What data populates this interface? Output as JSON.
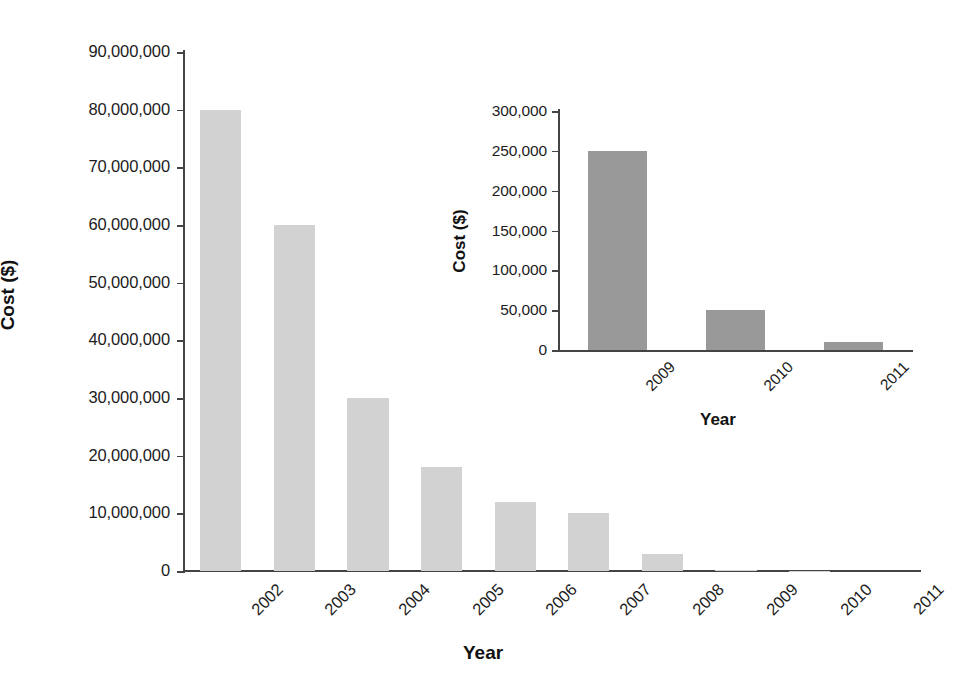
{
  "chart_data": [
    {
      "id": "main",
      "type": "bar",
      "title": "",
      "xlabel": "Year",
      "ylabel": "Cost ($)",
      "categories": [
        "2002",
        "2003",
        "2004",
        "2005",
        "2006",
        "2007",
        "2008",
        "2009",
        "2010",
        "2011"
      ],
      "values": [
        80000000,
        60000000,
        30000000,
        18000000,
        12000000,
        10000000,
        3000000,
        250000,
        50000,
        10000
      ],
      "ylim": [
        0,
        90000000
      ],
      "yticks": [
        0,
        10000000,
        20000000,
        30000000,
        40000000,
        50000000,
        60000000,
        70000000,
        80000000,
        90000000
      ],
      "ytick_labels": [
        "0",
        "10,000,000",
        "20,000,000",
        "30,000,000",
        "40,000,000",
        "50,000,000",
        "60,000,000",
        "70,000,000",
        "80,000,000",
        "90,000,000"
      ],
      "grid": false,
      "legend": "none",
      "bar_color": "#d2d2d2",
      "axis_color": "#444444",
      "tick_rotation": -45
    },
    {
      "id": "inset",
      "type": "bar",
      "title": "",
      "xlabel": "Year",
      "ylabel": "Cost ($)",
      "categories": [
        "2009",
        "2010",
        "2011"
      ],
      "values": [
        250000,
        50000,
        10000
      ],
      "ylim": [
        0,
        300000
      ],
      "yticks": [
        0,
        50000,
        100000,
        150000,
        200000,
        250000,
        300000
      ],
      "ytick_labels": [
        "0",
        "50,000",
        "100,000",
        "150,000",
        "200,000",
        "250,000",
        "300,000"
      ],
      "grid": false,
      "legend": "none",
      "bar_color": "#999999",
      "axis_color": "#444444",
      "tick_rotation": -45
    }
  ],
  "main": {
    "ylabel": "Cost ($)",
    "xlabel": "Year",
    "yticks": [
      {
        "label": "90,000,000",
        "value": 90000000
      },
      {
        "label": "80,000,000",
        "value": 80000000
      },
      {
        "label": "70,000,000",
        "value": 70000000
      },
      {
        "label": "60,000,000",
        "value": 60000000
      },
      {
        "label": "50,000,000",
        "value": 50000000
      },
      {
        "label": "40,000,000",
        "value": 40000000
      },
      {
        "label": "30,000,000",
        "value": 30000000
      },
      {
        "label": "20,000,000",
        "value": 20000000
      },
      {
        "label": "10,000,000",
        "value": 10000000
      },
      {
        "label": "0",
        "value": 0
      }
    ],
    "bars": [
      {
        "category": "2002",
        "value": 80000000
      },
      {
        "category": "2003",
        "value": 60000000
      },
      {
        "category": "2004",
        "value": 30000000
      },
      {
        "category": "2005",
        "value": 18000000
      },
      {
        "category": "2006",
        "value": 12000000
      },
      {
        "category": "2007",
        "value": 10000000
      },
      {
        "category": "2008",
        "value": 3000000
      },
      {
        "category": "2009",
        "value": 250000
      },
      {
        "category": "2010",
        "value": 50000
      },
      {
        "category": "2011",
        "value": 10000
      }
    ]
  },
  "inset": {
    "ylabel": "Cost ($)",
    "xlabel": "Year",
    "yticks": [
      {
        "label": "300,000",
        "value": 300000
      },
      {
        "label": "250,000",
        "value": 250000
      },
      {
        "label": "200,000",
        "value": 200000
      },
      {
        "label": "150,000",
        "value": 150000
      },
      {
        "label": "100,000",
        "value": 100000
      },
      {
        "label": "50,000",
        "value": 50000
      },
      {
        "label": "0",
        "value": 0
      }
    ],
    "bars": [
      {
        "category": "2009",
        "value": 250000
      },
      {
        "category": "2010",
        "value": 50000
      },
      {
        "category": "2011",
        "value": 10000
      }
    ]
  }
}
